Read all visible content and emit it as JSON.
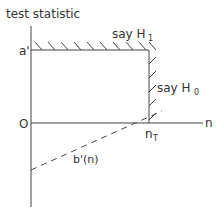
{
  "diagram": {
    "y_axis_label": "test statistic",
    "x_axis_label": "n",
    "origin_label": "O",
    "upper_threshold_label": "a'",
    "truncation_label_main": "n",
    "truncation_label_sub": "T",
    "region_h1_label": "say H",
    "region_h1_sub": "1",
    "region_h0_label": "say H",
    "region_h0_sub": "0",
    "lower_boundary_label": "b'(n)"
  },
  "colors": {
    "line": "#444444",
    "text": "#333333",
    "background": "#ffffff"
  }
}
